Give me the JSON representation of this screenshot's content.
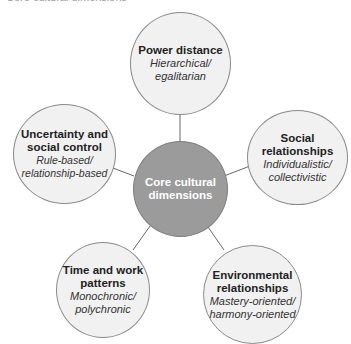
{
  "caption": "Core cultural dimensions",
  "center": {
    "title": "Core cultural dimensions",
    "color": "#9b9b9b"
  },
  "nodes": [
    {
      "title": "Power distance",
      "subtitle": "Hierarchical/ egalitarian"
    },
    {
      "title": "Social relationships",
      "subtitle": "Individualistic/ collectivistic"
    },
    {
      "title": "Environmental relationships",
      "subtitle": "Mastery-oriented/ harmony-oriented"
    },
    {
      "title": "Time and work patterns",
      "subtitle": "Monochronic/ polychronic"
    },
    {
      "title": "Uncertainty and social control",
      "subtitle": "Rule-based/ relationship-based"
    }
  ]
}
